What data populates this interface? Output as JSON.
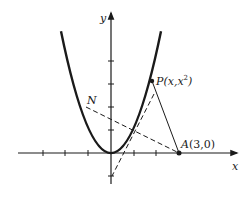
{
  "figure": {
    "type": "geometry-diagram",
    "axes": {
      "x_label": "x",
      "y_label": "y",
      "x_ticks": [
        -4,
        -3,
        -2,
        -1,
        1,
        2,
        3
      ],
      "y_ticks": [
        -1,
        1,
        2,
        3,
        4
      ]
    },
    "curve": {
      "equation": "y = x^2",
      "x_range": [
        -2.3,
        2.3
      ]
    },
    "points": {
      "P": {
        "label": "P(x,x",
        "superscript": "2",
        "closing": ")",
        "x": 1.78,
        "y": 3.17
      },
      "A": {
        "label": "A",
        "coords_text": "(3,0)",
        "x": 3,
        "y": 0
      }
    },
    "lines": {
      "N_label": "N",
      "segment_PA": "solid",
      "normal_N": "dashed",
      "tangent_at_P": "dashed"
    },
    "colors": {
      "ink": "#1a1a1a",
      "background": "#ffffff"
    }
  }
}
